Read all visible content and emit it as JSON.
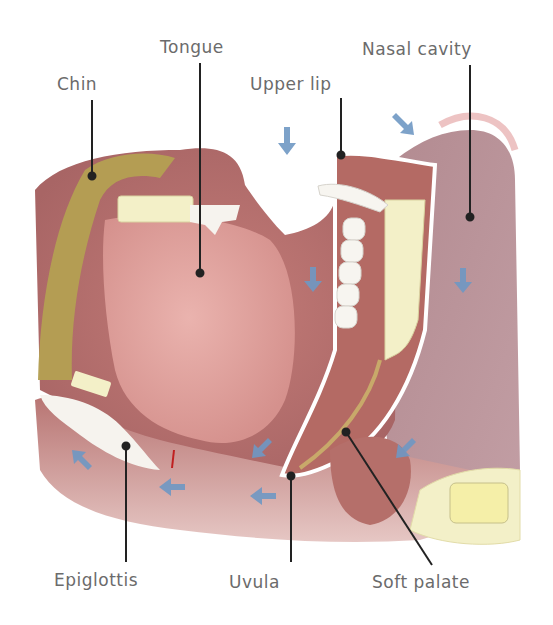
{
  "diagram": {
    "type": "anatomical-cross-section",
    "labels": [
      {
        "id": "chin",
        "text": "Chin"
      },
      {
        "id": "tongue",
        "text": "Tongue"
      },
      {
        "id": "upper_lip",
        "text": "Upper lip"
      },
      {
        "id": "nasal_cavity",
        "text": "Nasal cavity"
      },
      {
        "id": "epiglottis",
        "text": "Epiglottis"
      },
      {
        "id": "uvula",
        "text": "Uvula"
      },
      {
        "id": "soft_palate",
        "text": "Soft palate"
      }
    ],
    "arrows": {
      "count": 11,
      "color": "#6f98c4",
      "meaning": "direction of movement/flow"
    },
    "colors": {
      "tissue": "#b86f6f",
      "tongue": "#e1a6a2",
      "muscle_chin": "#b4a052",
      "bone": "#f3f0c8",
      "nasal_cavity": "#b8939a",
      "leader_line": "#222222",
      "label_text": "#6b6b6b"
    }
  }
}
